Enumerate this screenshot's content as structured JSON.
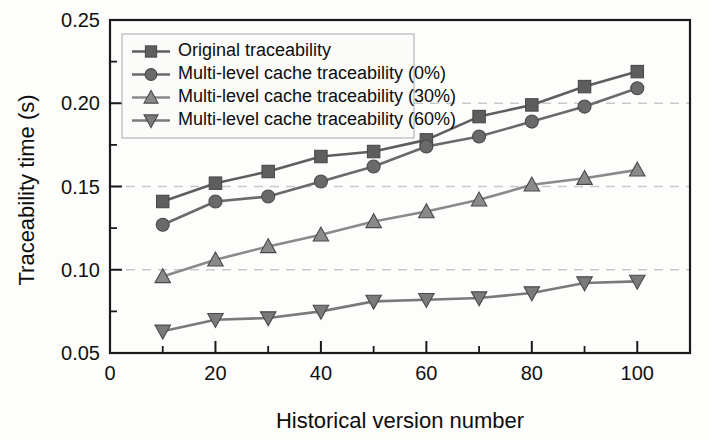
{
  "chart_data": {
    "type": "line",
    "title": "",
    "xlabel": "Historical version number",
    "ylabel": "Traceability time (s)",
    "xlim": [
      0,
      110
    ],
    "ylim": [
      0.05,
      0.25
    ],
    "x": [
      10,
      20,
      30,
      40,
      50,
      60,
      70,
      80,
      90,
      100
    ],
    "xticks": [
      0,
      20,
      40,
      60,
      80,
      100
    ],
    "xticklabels": [
      "0",
      "20",
      "40",
      "60",
      "80",
      "100"
    ],
    "yticks": [
      0.05,
      0.1,
      0.15,
      0.2,
      0.25
    ],
    "yticklabels": [
      "0.05",
      "0.10",
      "0.15",
      "0.20",
      "0.25"
    ],
    "yminorticks": [
      0.075,
      0.125,
      0.175,
      0.225
    ],
    "gridlines_y": [
      0.1,
      0.15,
      0.2
    ],
    "grid": "horizontal-dashed",
    "legend_position": "upper-left",
    "series": [
      {
        "name": "Original traceability",
        "marker": "square",
        "color": "#5e5e5e",
        "values": [
          0.141,
          0.152,
          0.159,
          0.168,
          0.171,
          0.178,
          0.192,
          0.199,
          0.21,
          0.219
        ]
      },
      {
        "name": "Multi-level cache traceability (0%)",
        "marker": "circle",
        "color": "#6a6a6a",
        "values": [
          0.127,
          0.141,
          0.144,
          0.153,
          0.162,
          0.174,
          0.18,
          0.189,
          0.198,
          0.209
        ]
      },
      {
        "name": "Multi-level cache traceability (30%)",
        "marker": "triangle-up",
        "color": "#8a8a8a",
        "values": [
          0.096,
          0.106,
          0.114,
          0.121,
          0.129,
          0.135,
          0.142,
          0.151,
          0.155,
          0.16
        ]
      },
      {
        "name": "Multi-level cache traceability (60%)",
        "marker": "triangle-down",
        "color": "#7a7a7a",
        "values": [
          0.063,
          0.07,
          0.071,
          0.075,
          0.081,
          0.082,
          0.083,
          0.086,
          0.092,
          0.093
        ]
      }
    ]
  },
  "legend": {
    "entries": [
      "Original traceability",
      "Multi-level cache traceability (0%)",
      "Multi-level cache traceability (30%)",
      "Multi-level cache traceability (60%)"
    ]
  },
  "axes": {
    "x_title": "Historical version number",
    "y_title": "Traceability time (s)"
  }
}
